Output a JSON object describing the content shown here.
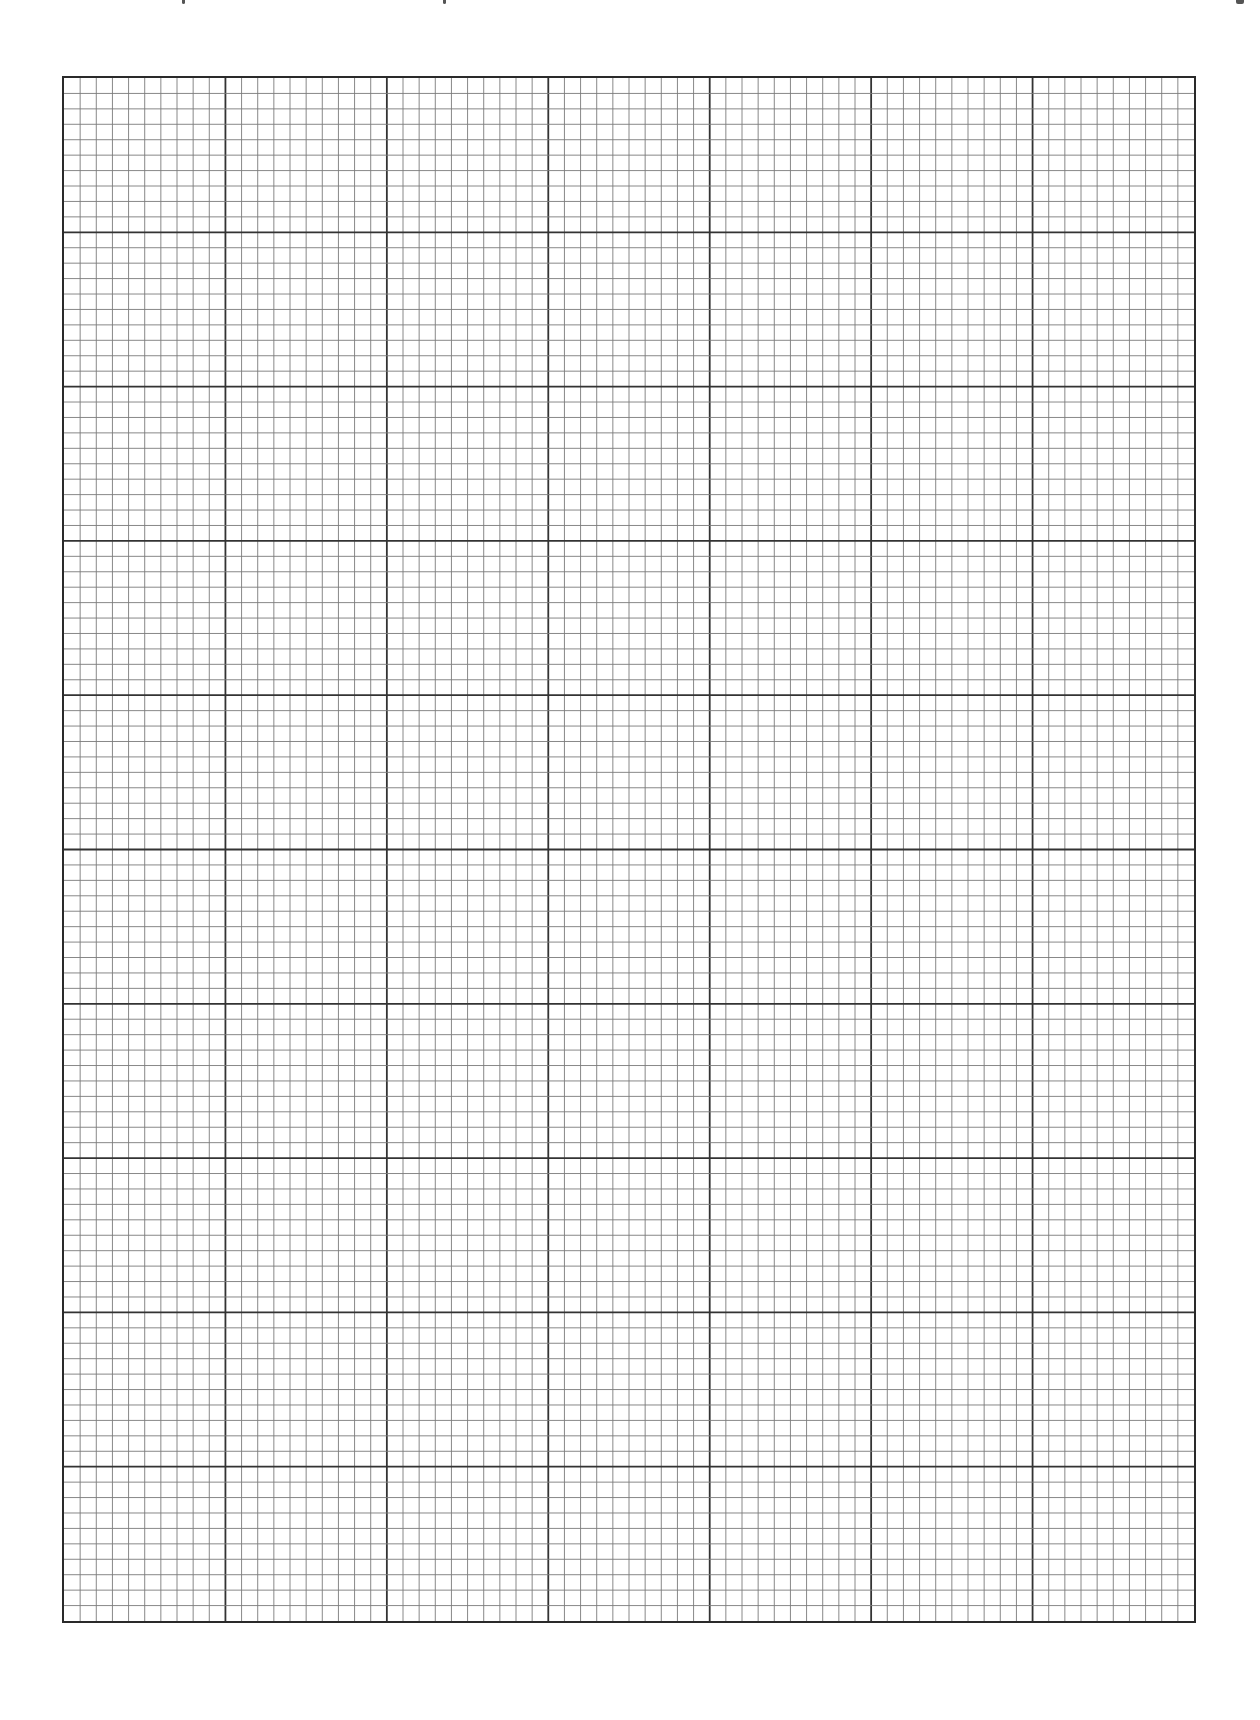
{
  "document": {
    "type": "graph paper page (scan)",
    "header_text_visible": false,
    "header_note": ""
  },
  "grid": {
    "major_columns": 7,
    "major_rows": 10,
    "minor_per_major": 10,
    "total_minor_columns": 70,
    "total_minor_rows": 100,
    "colors": {
      "border": "#2a2a2a",
      "major_line": "#333333",
      "minor_line": "#7a7a7a",
      "paper": "#ffffff"
    }
  }
}
